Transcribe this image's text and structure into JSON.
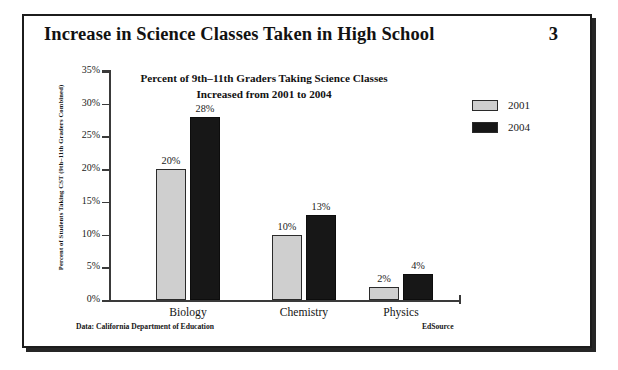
{
  "header": {
    "title": "Increase in Science Classes Taken in High School",
    "page_number": "3"
  },
  "subtitle": {
    "line1": "Percent of 9th–11th Graders Taking Science Classes",
    "line2": "Increased from 2001 to 2004"
  },
  "legend": {
    "position": "top-right",
    "items": [
      {
        "label": "2001",
        "color": "#cfcfcf"
      },
      {
        "label": "2004",
        "color": "#171717"
      }
    ]
  },
  "footer": {
    "source": "Data: California Department of Education",
    "brand": "EdSource"
  },
  "colors": {
    "series_2001": "#cfcfcf",
    "series_2004": "#171717",
    "axis": "#3a3a3a",
    "frame": "#1c1c1c",
    "text": "#121212"
  },
  "chart_data": {
    "type": "bar",
    "title": "Increase in Science Classes Taken in High School",
    "subtitle": "Percent of 9th–11th Graders Taking Science Classes Increased from 2001 to 2004",
    "xlabel": "",
    "ylabel": "Percent of Students Taking CST (9th–11th Graders Combined)",
    "categories": [
      "Biology",
      "Chemistry",
      "Physics"
    ],
    "series": [
      {
        "name": "2001",
        "color": "#cfcfcf",
        "values": [
          20,
          10,
          2
        ],
        "labels": [
          "20%",
          "10%",
          "2%"
        ]
      },
      {
        "name": "2004",
        "color": "#171717",
        "values": [
          28,
          13,
          4
        ],
        "labels": [
          "28%",
          "13%",
          "4%"
        ]
      }
    ],
    "ylim": [
      0,
      35
    ],
    "ytick_values": [
      0,
      5,
      10,
      15,
      20,
      25,
      30,
      35
    ],
    "ytick_labels": [
      "0%",
      "5%",
      "10%",
      "15%",
      "20%",
      "25%",
      "30%",
      "35%"
    ],
    "grid": false,
    "legend_position": "top-right"
  }
}
